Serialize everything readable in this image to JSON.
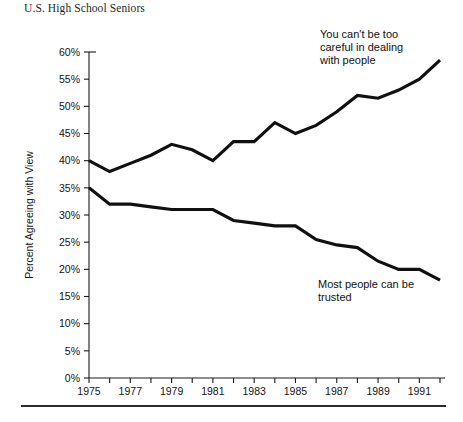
{
  "chart_data": {
    "type": "line",
    "title": "U.S. High School Seniors",
    "xlabel": "",
    "ylabel": "Percent Agreeing with View",
    "xlim": [
      1975,
      1992
    ],
    "ylim": [
      0,
      60
    ],
    "grid": false,
    "legend_position": "inline-annotations",
    "x": [
      1975,
      1976,
      1977,
      1978,
      1979,
      1980,
      1981,
      1982,
      1983,
      1984,
      1985,
      1986,
      1987,
      1988,
      1989,
      1990,
      1991,
      1992
    ],
    "xtick_labels": [
      "1975",
      "1977",
      "1979",
      "1981",
      "1983",
      "1985",
      "1987",
      "1989",
      "1991"
    ],
    "xtick_values": [
      1975,
      1977,
      1979,
      1981,
      1983,
      1985,
      1987,
      1989,
      1991
    ],
    "ytick_labels": [
      "0%",
      "5%",
      "10%",
      "15%",
      "20%",
      "25%",
      "30%",
      "35%",
      "40%",
      "45%",
      "50%",
      "55%",
      "60%"
    ],
    "ytick_values": [
      0,
      5,
      10,
      15,
      20,
      25,
      30,
      35,
      40,
      45,
      50,
      55,
      60
    ],
    "series": [
      {
        "name": "You can't be too careful in dealing with people",
        "annotation": "You can't be too\ncareful in dealing\nwith people",
        "color": "#101010",
        "values": [
          40,
          38,
          39.5,
          41,
          43,
          42,
          40,
          43.5,
          43.5,
          47,
          45,
          46.5,
          49,
          52,
          51.5,
          53,
          55,
          58.5
        ]
      },
      {
        "name": "Most people can be trusted",
        "annotation": "Most people can be\ntrusted",
        "color": "#101010",
        "values": [
          35,
          32,
          32,
          31.5,
          31,
          31,
          31,
          29,
          28.5,
          28,
          28,
          25.5,
          24.5,
          24,
          21.5,
          20,
          20,
          18
        ]
      }
    ]
  },
  "figure": {
    "title": "U.S. High School Seniors",
    "ylabel": "Percent Agreeing with View",
    "annotation_careful": "You can't be too\ncareful in dealing\nwith people",
    "annotation_trusted": "Most people can be\ntrusted"
  }
}
